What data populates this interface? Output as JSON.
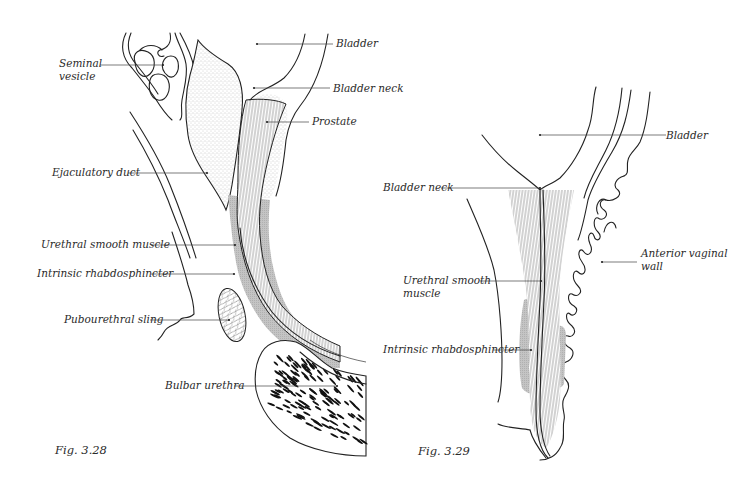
{
  "figures": [
    {
      "id": "fig-3-28",
      "caption": "Fig. 3.28",
      "subject": "Male urethra, sagittal section",
      "labels": {
        "bladder": "Bladder",
        "seminal_vesicle_1": "Seminal",
        "seminal_vesicle_2": "vesicle",
        "bladder_neck": "Bladder neck",
        "prostate": "Prostate",
        "ejaculatory_duct": "Ejaculatory duct",
        "urethral_smooth_muscle": "Urethral smooth muscle",
        "intrinsic_rhabdosphincter": "Intrinsic rhabdosphincter",
        "pubourethral_sling": "Pubourethral sling",
        "bulbar_urethra": "Bulbar urethra"
      }
    },
    {
      "id": "fig-3-29",
      "caption": "Fig. 3.29",
      "subject": "Female urethra, sagittal section",
      "labels": {
        "bladder": "Bladder",
        "bladder_neck": "Bladder neck",
        "anterior_vaginal_wall_1": "Anterior vaginal",
        "anterior_vaginal_wall_2": "wall",
        "urethral_smooth_muscle_1": "Urethral smooth",
        "urethral_smooth_muscle_2": "muscle",
        "intrinsic_rhabdosphincter": "Intrinsic rhabdosphincter"
      }
    }
  ],
  "colors": {
    "ink": "#222222",
    "shading": "#bdbdbd",
    "stipple": "#9a9a9a",
    "background": "#ffffff"
  }
}
